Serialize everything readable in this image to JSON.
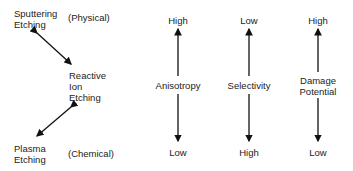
{
  "left": {
    "sputtering": [
      "Sputtering",
      "Etching"
    ],
    "physical": "(Physical)",
    "rie": [
      "Reactive",
      "Ion",
      "Etching"
    ],
    "plasma": [
      "Plasma",
      "Etching"
    ],
    "chemical": "(Chemical)"
  },
  "columns": [
    {
      "label": [
        "Anisotropy"
      ],
      "top": "High",
      "bottom": "Low"
    },
    {
      "label": [
        "Selectivity"
      ],
      "top": "Low",
      "bottom": "High"
    },
    {
      "label": [
        "Damage",
        "Potential"
      ],
      "top": "High",
      "bottom": "Low"
    }
  ]
}
